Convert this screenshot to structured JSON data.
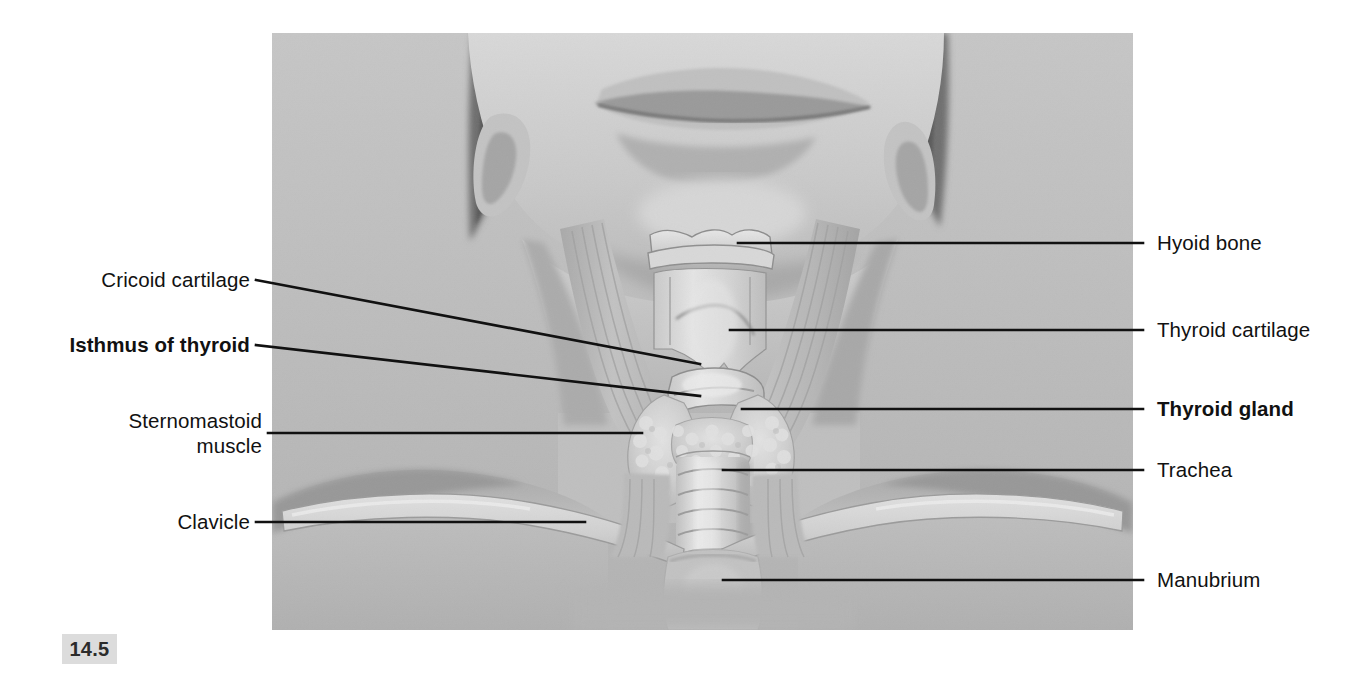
{
  "figure": {
    "number": "14.5",
    "photo_alt_name": "anterior-neck-photograph"
  },
  "labels_left": [
    {
      "id": "cricoid-cartilage",
      "text": "Cricoid cartilage",
      "bold": false,
      "lines": 1
    },
    {
      "id": "isthmus-of-thyroid",
      "text": "Isthmus of thyroid",
      "bold": true,
      "lines": 1
    },
    {
      "id": "sternomastoid-muscle",
      "text": "Sternomastoid\nmuscle",
      "bold": false,
      "lines": 2
    },
    {
      "id": "clavicle",
      "text": "Clavicle",
      "bold": false,
      "lines": 1
    }
  ],
  "labels_right": [
    {
      "id": "hyoid-bone",
      "text": "Hyoid bone",
      "bold": false
    },
    {
      "id": "thyroid-cartilage",
      "text": "Thyroid cartilage",
      "bold": false
    },
    {
      "id": "thyroid-gland",
      "text": "Thyroid gland",
      "bold": true
    },
    {
      "id": "trachea",
      "text": "Trachea",
      "bold": false
    },
    {
      "id": "manubrium",
      "text": "Manubrium",
      "bold": false
    }
  ],
  "colors": {
    "leader_line": "#111111",
    "page_background": "#ffffff",
    "photo_background": "#b9b9b9",
    "badge_background": "#dcdcdc",
    "text": "#111111"
  }
}
